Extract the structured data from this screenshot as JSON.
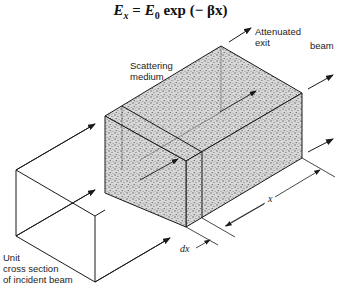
{
  "equation": {
    "text": "E_x = E_0 exp(−βx)",
    "lhs": "E",
    "lhs_sub": "x",
    "equals": " = ",
    "rhs_E": "E",
    "rhs_sub": "0",
    "rhs_rest": " exp (− βx)"
  },
  "labels": {
    "scattering_medium": "Scattering\nmedium",
    "attenuated_exit": "Attenuated\nexit",
    "beam": "beam",
    "unit_cross_section": "Unit\ncross section\nof incident beam",
    "x": "x",
    "dx": "dx"
  },
  "colors": {
    "line": "#1a1a1a",
    "stipple": "#9a9a9a",
    "background": "#ffffff"
  }
}
